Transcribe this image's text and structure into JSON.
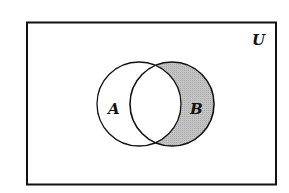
{
  "diagram": {
    "type": "venn",
    "universe_label": "U",
    "sets": [
      {
        "label": "A",
        "cx": 139,
        "cy": 104,
        "r": 42
      },
      {
        "label": "B",
        "cx": 172,
        "cy": 104,
        "r": 42
      }
    ],
    "shaded_region": "B minus A",
    "colors": {
      "stroke": "#111111",
      "shade": "#bdbdbd",
      "background": "#ffffff"
    }
  }
}
